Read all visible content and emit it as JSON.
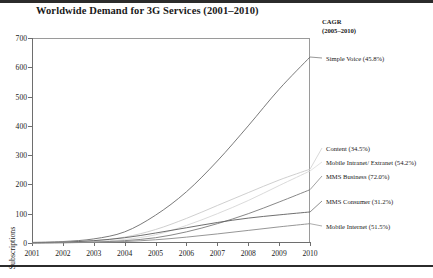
{
  "title": "Worldwide Demand for 3G Services (2001–2010)",
  "cagr_header": {
    "line1": "CAGR",
    "line2": "(2005–2010)"
  },
  "axis": {
    "y_title": "Subscriptions",
    "y_ticks": [
      "0",
      "100",
      "200",
      "300",
      "400",
      "500",
      "600",
      "700"
    ],
    "x_ticks": [
      "2001",
      "2002",
      "2003",
      "2004",
      "2005",
      "2006",
      "2007",
      "2008",
      "2009",
      "2010"
    ]
  },
  "labels": {
    "simple_voice": "Simple Voice (45.8%)",
    "content": "Content (34.5%)",
    "mobile_intranet": "Mobile Intranet/ Extranet (54.2%)",
    "mms_business": "MMS Business (72.0%)",
    "mms_consumer": "MMS Consumer (31.2%)",
    "mobile_internet": "Mobile Internet (51.5%)"
  },
  "chart_data": {
    "type": "line",
    "title": "Worldwide Demand for 3G Services (2001–2010)",
    "xlabel": "",
    "ylabel": "Subscriptions",
    "x": [
      2001,
      2002,
      2003,
      2004,
      2005,
      2006,
      2007,
      2008,
      2009,
      2010
    ],
    "ylim": [
      0,
      700
    ],
    "xlim": [
      2001,
      2010
    ],
    "grid": false,
    "legend_position": "right-inline-labels",
    "series": [
      {
        "name": "Simple Voice",
        "cagr": "45.8%",
        "color": "#6b6b6b",
        "values": [
          2,
          5,
          14,
          38,
          95,
          175,
          280,
          400,
          525,
          635
        ]
      },
      {
        "name": "Content",
        "cagr": "34.5%",
        "color": "#c9c9c9",
        "values": [
          1,
          3,
          8,
          20,
          46,
          84,
          128,
          172,
          215,
          252
        ]
      },
      {
        "name": "Mobile Intranet/ Extranet",
        "cagr": "54.2%",
        "color": "#d6d6d6",
        "values": [
          1,
          2,
          5,
          12,
          28,
          60,
          100,
          145,
          196,
          246
        ]
      },
      {
        "name": "MMS Business",
        "cagr": "72.0%",
        "color": "#7a7a7a",
        "values": [
          0,
          1,
          3,
          8,
          18,
          38,
          66,
          100,
          140,
          182
        ]
      },
      {
        "name": "MMS Consumer",
        "cagr": "31.2%",
        "color": "#5f5f5f",
        "values": [
          1,
          3,
          8,
          18,
          34,
          52,
          70,
          85,
          96,
          106
        ]
      },
      {
        "name": "Mobile Internet",
        "cagr": "51.5%",
        "color": "#8a8a8a",
        "values": [
          0,
          1,
          2,
          5,
          11,
          20,
          31,
          43,
          55,
          66
        ]
      }
    ]
  }
}
